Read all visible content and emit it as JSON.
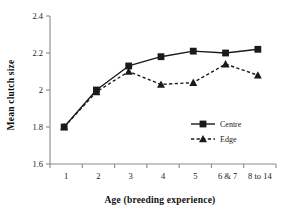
{
  "chart_data": {
    "type": "line",
    "title": "",
    "xlabel": "Age (breeding experience)",
    "ylabel": "Mean clutch size",
    "categories": [
      "1",
      "2",
      "3",
      "4",
      "5",
      "6 & 7",
      "8 to 14"
    ],
    "ylim": [
      1.6,
      2.4
    ],
    "yticks": [
      "1.6",
      "1.8",
      "2",
      "2.2",
      "2.4"
    ],
    "ytick_values": [
      1.6,
      1.8,
      2.0,
      2.2,
      2.4
    ],
    "grid": false,
    "legend_position": "inside-lower-right",
    "series": [
      {
        "name": "Centre",
        "values": [
          1.8,
          2.0,
          2.13,
          2.18,
          2.21,
          2.2,
          2.22
        ],
        "marker": "square",
        "line_style": "solid",
        "color": "#1a1a1a"
      },
      {
        "name": "Edge",
        "values": [
          1.8,
          1.99,
          2.1,
          2.03,
          2.04,
          2.14,
          2.08
        ],
        "marker": "triangle",
        "line_style": "dashed",
        "color": "#1a1a1a"
      }
    ]
  },
  "axis": {
    "line_color": "#8a8a8a",
    "tick_color": "#8a8a8a"
  }
}
